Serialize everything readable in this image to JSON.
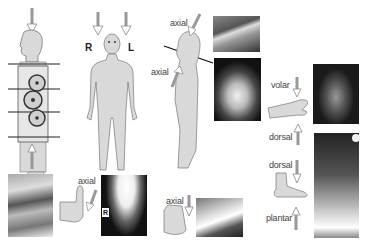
{
  "figure": {
    "panels": [
      {
        "id": "transverse-body",
        "description": "side-view body with transverse slice lines and coil array"
      },
      {
        "id": "frontal-body",
        "labels": {
          "right": "R",
          "left": "L"
        }
      },
      {
        "id": "head-axial",
        "labels": {
          "upper": "axial",
          "lower": "axial"
        }
      },
      {
        "id": "hand",
        "labels": {
          "top": "volar",
          "bottom": "dorsal"
        }
      },
      {
        "id": "foot",
        "labels": {
          "top": "dorsal",
          "bottom": "plantar"
        }
      },
      {
        "id": "heel-axial",
        "labels": {
          "arrow": "axial"
        },
        "xray_marker": "R"
      },
      {
        "id": "patella-axial",
        "labels": {
          "arrow": "axial"
        }
      }
    ],
    "labels": {
      "R": "R",
      "L": "L",
      "axial_head_top": "axial",
      "axial_head_bottom": "axial",
      "volar": "volar",
      "dorsal_hand": "dorsal",
      "dorsal_foot": "dorsal",
      "plantar": "plantar",
      "axial_heel": "axial",
      "axial_knee": "axial",
      "xray_marker_R": "R"
    },
    "colors": {
      "body_fill": "#d9d9d9",
      "outline": "#777777",
      "xray_bg": "#111111",
      "line": "#111111"
    }
  }
}
